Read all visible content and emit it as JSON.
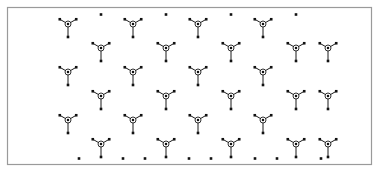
{
  "figure": {
    "background_color": "#ffffff",
    "width": 380,
    "height": 173
  },
  "frame": {
    "name": "border-frame",
    "x": 7.5,
    "y": 7.5,
    "width": 364,
    "height": 157,
    "stroke_color": "#9a9a9a",
    "stroke_width": 1.2,
    "fill_color": "#ffffff"
  },
  "style": {
    "leg_color": "#1a1a1a",
    "leg_width": 1.0,
    "hub_stroke_color": "#1a1a1a",
    "hub_stroke_width": 0.9,
    "hub_fill_color": "#ffffff",
    "hub_radius_outer": 3.0,
    "hub_radius_inner": 1.25,
    "dot_color": "#111111",
    "dot_size": 2.6,
    "leg_length_up": 9.5,
    "leg_length_down": 13.0,
    "arm_angle_degrees": 30
  },
  "chart_data": {
    "type": "scatter",
    "xlabel": "",
    "ylabel": "",
    "xlim": [
      7.5,
      371.5
    ],
    "ylim": [
      7.5,
      164.5
    ],
    "grid": false,
    "legend": null,
    "motif_shape": "tripod",
    "motif_leg_directions_degrees": [
      90,
      210,
      330
    ],
    "motif_count": 36,
    "isolated_dot_count": 18,
    "motif_centers": [
      [
        68,
        24
      ],
      [
        133,
        24
      ],
      [
        198,
        24
      ],
      [
        263,
        24
      ],
      [
        101,
        48
      ],
      [
        166,
        48
      ],
      [
        231,
        48
      ],
      [
        296,
        48
      ],
      [
        68,
        72
      ],
      [
        133,
        72
      ],
      [
        198,
        72
      ],
      [
        263,
        72
      ],
      [
        101,
        96
      ],
      [
        166,
        96
      ],
      [
        231,
        96
      ],
      [
        296,
        96
      ],
      [
        68,
        120
      ],
      [
        133,
        120
      ],
      [
        198,
        120
      ],
      [
        263,
        120
      ],
      [
        101,
        144
      ],
      [
        166,
        144
      ],
      [
        231,
        144
      ],
      [
        296,
        144
      ],
      [
        36,
        48
      ],
      [
        36,
        96
      ],
      [
        36,
        144
      ],
      [
        328,
        24
      ],
      [
        328,
        72
      ],
      [
        328,
        120
      ],
      [
        36,
        24
      ],
      [
        101,
        24
      ],
      [
        166,
        24
      ],
      [
        231,
        24
      ],
      [
        296,
        24
      ],
      [
        328,
        48
      ]
    ],
    "isolated_dots": [
      [
        101,
        15
      ],
      [
        166,
        15
      ],
      [
        231,
        15
      ],
      [
        296,
        15
      ],
      [
        68,
        159
      ],
      [
        101,
        159
      ],
      [
        133,
        159
      ],
      [
        166,
        159
      ],
      [
        198,
        159
      ],
      [
        231,
        159
      ],
      [
        263,
        159
      ],
      [
        296,
        159
      ],
      [
        328,
        159
      ],
      [
        36,
        15
      ],
      [
        328,
        15
      ],
      [
        36,
        159
      ],
      [
        133,
        159
      ],
      [
        263,
        159
      ]
    ]
  },
  "render_plan": {
    "motif_rows": [
      {
        "y": 24,
        "x_start": 68,
        "x_step": 65,
        "count": 4
      },
      {
        "y": 48,
        "x_start": 101,
        "x_step": 65,
        "count": 4
      },
      {
        "y": 72,
        "x_start": 68,
        "x_step": 65,
        "count": 4
      },
      {
        "y": 96,
        "x_start": 101,
        "x_step": 65,
        "count": 4
      },
      {
        "y": 120,
        "x_start": 68,
        "x_step": 65,
        "count": 4
      },
      {
        "y": 144,
        "x_start": 101,
        "x_step": 65,
        "count": 4
      }
    ],
    "extra_motifs": [
      [
        328,
        48
      ],
      [
        328,
        96
      ],
      [
        328,
        144
      ]
    ],
    "top_dot_row": {
      "y": 14.5,
      "x_start": 101,
      "x_step": 65,
      "count": 4
    },
    "bottom_dot_row": {
      "y": 158.5,
      "x_start": 79,
      "x_step": 22,
      "count": 12
    },
    "bottom_dot_skip_near_motifs": true
  }
}
